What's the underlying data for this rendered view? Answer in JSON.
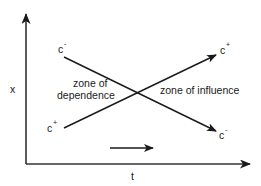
{
  "diagram": {
    "axes": {
      "x_label": "t",
      "y_label": "x"
    },
    "lines": [
      {
        "name": "c-minus-characteristic",
        "start_label": {
          "base": "c",
          "sup": "-"
        },
        "end_label": {
          "base": "c",
          "sup": "-"
        }
      },
      {
        "name": "c-plus-characteristic",
        "start_label": {
          "base": "c",
          "sup": "+"
        },
        "end_label": {
          "base": "c",
          "sup": "+"
        }
      }
    ],
    "zones": {
      "dependence_line1": "zone of",
      "dependence_line2": "dependence",
      "influence": "zone of influence"
    },
    "direction_arrow": "time direction"
  },
  "colors": {
    "line": "#1a1a1a",
    "axis": "#333333",
    "background": "#ffffff"
  }
}
